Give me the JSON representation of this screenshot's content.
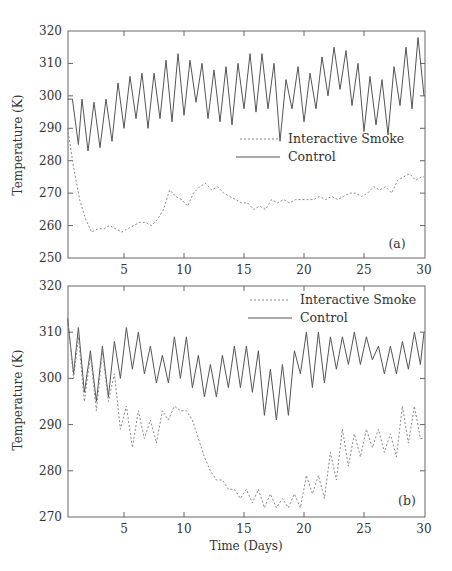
{
  "chart_data": [
    {
      "type": "line",
      "panel": "(a)",
      "title": "",
      "xlabel": "",
      "ylabel": "Temperature (K)",
      "xlim": [
        0,
        30
      ],
      "ylim": [
        250,
        320
      ],
      "xticks": [
        5,
        10,
        15,
        20,
        25,
        30
      ],
      "yticks": [
        250,
        260,
        270,
        280,
        290,
        300,
        310,
        320
      ],
      "legend": {
        "position": "center-right",
        "entries": [
          "Interactive Smoke",
          "Control"
        ]
      },
      "series": [
        {
          "name": "Control",
          "style": "solid",
          "x": [
            0.3,
            0.7,
            1.2,
            1.5,
            2.0,
            2.5,
            3.0,
            3.5,
            4.0,
            4.5,
            5.0,
            5.5,
            6.0,
            6.5,
            7.0,
            7.5,
            8.0,
            8.5,
            9.0,
            9.5,
            10.0,
            10.5,
            11.0,
            11.5,
            12.0,
            12.5,
            13.0,
            13.5,
            14.0,
            14.5,
            15.0,
            15.5,
            16.0,
            16.5,
            17.0,
            17.5,
            18.0,
            18.5,
            19.0,
            19.5,
            20.0,
            20.5,
            21.0,
            21.5,
            22.0,
            22.5,
            23.0,
            23.5,
            24.0,
            24.5,
            25.0,
            25.5,
            26.0,
            26.5,
            27.0,
            27.5,
            28.0,
            28.5,
            29.0,
            29.5,
            30.0
          ],
          "y": [
            299,
            299,
            285,
            299,
            283,
            298,
            284,
            299,
            286,
            304,
            290,
            306,
            293,
            307,
            290,
            307,
            293,
            311,
            292,
            313,
            294,
            311,
            298,
            310,
            293,
            308,
            292,
            309,
            291,
            310,
            296,
            313,
            295,
            313,
            296,
            310,
            286,
            305,
            296,
            309,
            292,
            307,
            296,
            312,
            300,
            315,
            302,
            314,
            297,
            310,
            289,
            306,
            291,
            305,
            288,
            309,
            297,
            315,
            296,
            318,
            300
          ]
        },
        {
          "name": "Interactive Smoke",
          "style": "dashed",
          "x": [
            0.3,
            0.8,
            1.3,
            1.8,
            2.3,
            2.8,
            3.3,
            3.8,
            4.3,
            4.8,
            5.3,
            5.8,
            6.3,
            6.8,
            7.3,
            7.8,
            8.3,
            8.8,
            9.3,
            9.8,
            10.3,
            10.8,
            11.3,
            11.8,
            12.3,
            12.8,
            13.3,
            13.8,
            14.3,
            14.8,
            15.3,
            15.8,
            16.3,
            16.8,
            17.3,
            17.8,
            18.3,
            18.8,
            19.3,
            19.8,
            20.3,
            20.8,
            21.3,
            21.8,
            22.3,
            22.8,
            23.3,
            23.8,
            24.3,
            24.8,
            25.3,
            25.8,
            26.3,
            26.8,
            27.3,
            27.8,
            28.3,
            28.8,
            29.3,
            29.8,
            30.0
          ],
          "y": [
            290,
            278,
            268,
            262,
            258,
            259,
            259,
            260,
            259,
            258,
            259,
            260,
            261,
            261,
            260,
            262,
            265,
            271,
            269,
            268,
            266,
            270,
            272,
            273,
            271,
            272,
            270,
            269,
            268,
            267,
            267,
            265,
            266,
            265,
            268,
            267,
            268,
            267,
            268,
            268,
            268,
            268,
            269,
            268,
            269,
            268,
            269,
            270,
            270,
            269,
            270,
            272,
            271,
            272,
            270,
            274,
            275,
            276,
            274,
            275,
            275
          ]
        }
      ],
      "annotation": "(a)"
    },
    {
      "type": "line",
      "panel": "(b)",
      "title": "",
      "xlabel": "Time (Days)",
      "ylabel": "Temperature (K)",
      "xlim": [
        0,
        30
      ],
      "ylim": [
        270,
        320
      ],
      "xticks": [
        5,
        10,
        15,
        20,
        25,
        30
      ],
      "yticks": [
        270,
        280,
        290,
        300,
        310,
        320
      ],
      "legend": {
        "position": "upper-right",
        "entries": [
          "Interactive Smoke",
          "Control"
        ]
      },
      "series": [
        {
          "name": "Control",
          "style": "solid",
          "x": [
            0.3,
            0.8,
            1.2,
            1.7,
            2.2,
            2.7,
            3.2,
            3.7,
            4.2,
            4.7,
            5.2,
            5.7,
            6.2,
            6.7,
            7.2,
            7.7,
            8.2,
            8.7,
            9.2,
            9.7,
            10.2,
            10.7,
            11.2,
            11.7,
            12.2,
            12.7,
            13.2,
            13.7,
            14.2,
            14.7,
            15.2,
            15.7,
            16.2,
            16.7,
            17.2,
            17.7,
            18.2,
            18.7,
            19.2,
            19.7,
            20.2,
            20.7,
            21.2,
            21.7,
            22.2,
            22.7,
            23.2,
            23.7,
            24.2,
            24.7,
            25.2,
            25.7,
            26.2,
            26.7,
            27.2,
            27.7,
            28.2,
            28.7,
            29.2,
            29.7,
            30.0
          ],
          "y": [
            313,
            301,
            311,
            297,
            306,
            295,
            307,
            296,
            308,
            300,
            311,
            302,
            310,
            301,
            307,
            299,
            305,
            299,
            309,
            300,
            309,
            298,
            305,
            296,
            303,
            296,
            305,
            298,
            307,
            298,
            307,
            297,
            306,
            292,
            302,
            291,
            303,
            292,
            306,
            301,
            310,
            298,
            310,
            299,
            309,
            302,
            309,
            303,
            310,
            303,
            309,
            304,
            307,
            301,
            307,
            301,
            308,
            302,
            310,
            303,
            310
          ]
        },
        {
          "name": "Interactive Smoke",
          "style": "dashed",
          "x": [
            0.3,
            0.8,
            1.2,
            1.7,
            2.2,
            2.7,
            3.2,
            3.7,
            4.2,
            4.7,
            5.2,
            5.7,
            6.2,
            6.7,
            7.2,
            7.7,
            8.2,
            8.7,
            9.2,
            9.7,
            10.2,
            10.7,
            11.2,
            11.7,
            12.2,
            12.7,
            13.2,
            13.7,
            14.2,
            14.7,
            15.2,
            15.7,
            16.2,
            16.7,
            17.2,
            17.7,
            18.2,
            18.7,
            19.2,
            19.7,
            20.2,
            20.7,
            21.2,
            21.7,
            22.2,
            22.7,
            23.2,
            23.7,
            24.2,
            24.7,
            25.2,
            25.7,
            26.2,
            26.7,
            27.2,
            27.7,
            28.2,
            28.7,
            29.2,
            29.7,
            30.0
          ],
          "y": [
            313,
            300,
            309,
            295,
            305,
            293,
            306,
            295,
            301,
            289,
            294,
            285,
            293,
            287,
            291,
            286,
            293,
            291,
            294,
            293,
            293,
            291,
            287,
            283,
            280,
            278,
            278,
            276,
            276,
            274,
            276,
            273,
            276,
            272,
            275,
            272,
            274,
            272,
            275,
            272,
            279,
            275,
            279,
            274,
            284,
            278,
            289,
            281,
            288,
            283,
            289,
            285,
            289,
            284,
            288,
            283,
            294,
            286,
            294,
            287,
            287
          ]
        }
      ],
      "annotation": "(b)"
    }
  ],
  "panel_a": {
    "ylabel": "Temperature (K)",
    "yticks": [
      "250",
      "260",
      "270",
      "280",
      "290",
      "300",
      "310",
      "320"
    ],
    "xticks": [
      "5",
      "10",
      "15",
      "20",
      "25",
      "30"
    ],
    "legend_smoke": "Interactive Smoke",
    "legend_control": "Control",
    "tag": "(a)"
  },
  "panel_b": {
    "ylabel": "Temperature (K)",
    "yticks": [
      "270",
      "280",
      "290",
      "300",
      "310",
      "320"
    ],
    "xticks": [
      "5",
      "10",
      "15",
      "20",
      "25",
      "30"
    ],
    "legend_smoke": "Interactive Smoke",
    "legend_control": "Control",
    "tag": "(b)",
    "xlabel": "Time (Days)"
  }
}
